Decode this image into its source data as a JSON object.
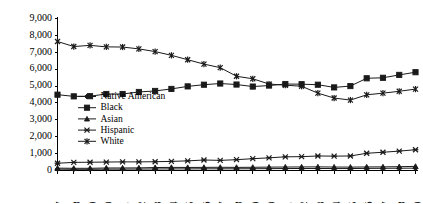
{
  "chart_data": {
    "type": "line",
    "title": "",
    "subtitle": "",
    "xlabel": "",
    "ylabel": "",
    "grid": false,
    "legend_position": "inside-left",
    "categories": [
      "1987",
      "1988",
      "1989",
      "1990",
      "1991",
      "1992",
      "1993",
      "1994",
      "1995",
      "1996",
      "1997",
      "1998",
      "1999",
      "2000",
      "2001",
      "2002",
      "2003",
      "2004",
      "2005",
      "2006",
      "2007",
      "2008",
      "2009"
    ],
    "ylim": [
      0,
      9000
    ],
    "ytick_labels": [
      "0",
      "1,000",
      "2,000",
      "3,000",
      "4,000",
      "5,000",
      "6,000",
      "7,000",
      "8,000",
      "9,000"
    ],
    "ytick_values": [
      0,
      1000,
      2000,
      3000,
      4000,
      5000,
      6000,
      7000,
      8000,
      9000
    ],
    "series": [
      {
        "name": "Native American",
        "marker": "diamond",
        "color": "#1a1a1a",
        "values": [
          80,
          70,
          70,
          80,
          80,
          85,
          90,
          95,
          95,
          100,
          100,
          100,
          105,
          110,
          115,
          120,
          120,
          115,
          115,
          125,
          130,
          135,
          140
        ]
      },
      {
        "name": "Black",
        "marker": "square",
        "color": "#1a1a1a",
        "values": [
          4490,
          4390,
          4400,
          4530,
          4530,
          4650,
          4710,
          4830,
          4980,
          5080,
          5150,
          5090,
          4970,
          5030,
          5120,
          5110,
          5080,
          4920,
          5000,
          5460,
          5490,
          5660,
          5820
        ]
      },
      {
        "name": "Asian",
        "marker": "triangle",
        "color": "#1a1a1a",
        "values": [
          140,
          130,
          130,
          150,
          150,
          155,
          175,
          185,
          180,
          185,
          190,
          185,
          190,
          200,
          205,
          210,
          215,
          205,
          200,
          210,
          215,
          225,
          245
        ]
      },
      {
        "name": "Hispanic",
        "marker": "x",
        "color": "#1a1a1a",
        "values": [
          430,
          480,
          490,
          500,
          510,
          510,
          520,
          540,
          570,
          620,
          600,
          640,
          700,
          750,
          810,
          820,
          860,
          850,
          860,
          1020,
          1080,
          1150,
          1230
        ]
      },
      {
        "name": "White",
        "marker": "star",
        "color": "#1a1a1a",
        "values": [
          7640,
          7340,
          7410,
          7320,
          7310,
          7200,
          7040,
          6820,
          6560,
          6300,
          6090,
          5580,
          5430,
          5120,
          5050,
          4990,
          4580,
          4290,
          4170,
          4480,
          4580,
          4690,
          4820
        ]
      }
    ]
  },
  "legend": {
    "items": [
      {
        "label": "Native American"
      },
      {
        "label": "Black"
      },
      {
        "label": "Asian"
      },
      {
        "label": "Hispanic"
      },
      {
        "label": "White"
      }
    ]
  }
}
